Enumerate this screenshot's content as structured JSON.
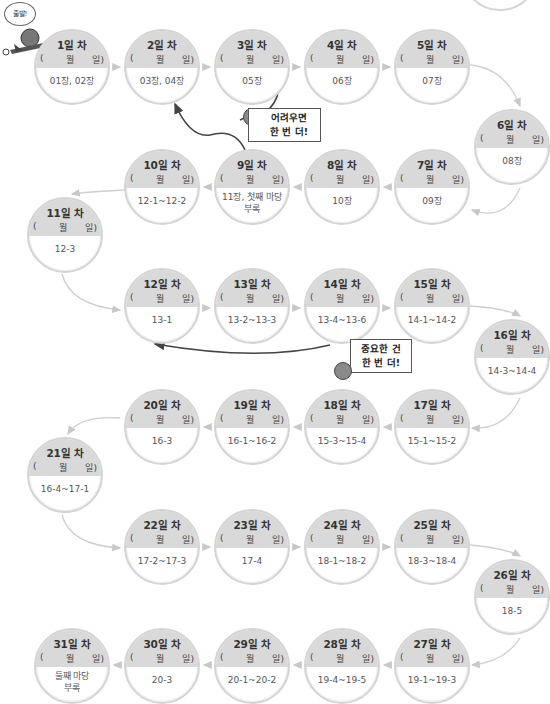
{
  "diagram": {
    "type": "study-plan-path",
    "date_template": {
      "open": "(",
      "month": "월",
      "day": "일)"
    },
    "start_label": "출발!",
    "callouts": [
      {
        "text_line1": "어려우면",
        "text_line2": "한 번 더!",
        "from_day": 3,
        "back_to_day": 2
      },
      {
        "text_line1": "중요한 건",
        "text_line2": "한 번 더!",
        "from_day": 14,
        "back_to_day": 12
      }
    ],
    "days": [
      {
        "title": "1일 차",
        "content": "01장, 02장"
      },
      {
        "title": "2일 차",
        "content": "03장, 04장"
      },
      {
        "title": "3일 차",
        "content": "05장"
      },
      {
        "title": "4일 차",
        "content": "06장"
      },
      {
        "title": "5일 차",
        "content": "07장"
      },
      {
        "title": "6일 차",
        "content": "08장"
      },
      {
        "title": "7일 차",
        "content": "09장"
      },
      {
        "title": "8일 차",
        "content": "10장"
      },
      {
        "title": "9일 차",
        "content": "11장, 첫째 마당",
        "content2": "부록"
      },
      {
        "title": "10일 차",
        "content": "12-1~12-2"
      },
      {
        "title": "11일 차",
        "content": "12-3"
      },
      {
        "title": "12일 차",
        "content": "13-1"
      },
      {
        "title": "13일 차",
        "content": "13-2~13-3"
      },
      {
        "title": "14일 차",
        "content": "13-4~13-6"
      },
      {
        "title": "15일 차",
        "content": "14-1~14-2"
      },
      {
        "title": "16일 차",
        "content": "14-3~14-4"
      },
      {
        "title": "17일 차",
        "content": "15-1~15-2"
      },
      {
        "title": "18일 차",
        "content": "15-3~15-4"
      },
      {
        "title": "19일 차",
        "content": "16-1~16-2"
      },
      {
        "title": "20일 차",
        "content": "16-3"
      },
      {
        "title": "21일 차",
        "content": "16-4~17-1"
      },
      {
        "title": "22일 차",
        "content": "17-2~17-3"
      },
      {
        "title": "23일 차",
        "content": "17-4"
      },
      {
        "title": "24일 차",
        "content": "18-1~18-2"
      },
      {
        "title": "25일 차",
        "content": "18-3~18-4"
      },
      {
        "title": "26일 차",
        "content": "18-5"
      },
      {
        "title": "27일 차",
        "content": "19-1~19-3"
      },
      {
        "title": "28일 차",
        "content": "19-4~19-5"
      },
      {
        "title": "29일 차",
        "content": "20-1~20-2"
      },
      {
        "title": "30일 차",
        "content": "20-3"
      },
      {
        "title": "31일 차",
        "content": "둘째 마당",
        "content2": "부록"
      }
    ]
  }
}
